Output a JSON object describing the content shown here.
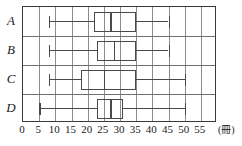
{
  "chart_data": {
    "type": "box",
    "title": "",
    "xlabel": "(冊)",
    "ylabel": "",
    "xlim": [
      0,
      60
    ],
    "xticks": [
      0,
      5,
      10,
      15,
      20,
      25,
      30,
      35,
      40,
      45,
      50,
      55
    ],
    "xtick_labels": [
      "0",
      "5",
      "10",
      "15",
      "20",
      "25",
      "30",
      "35",
      "40",
      "45",
      "50",
      "55"
    ],
    "grid": true,
    "grid_axis": "x",
    "unit_label": "(冊)",
    "categories": [
      "A",
      "B",
      "C",
      "D"
    ],
    "boxes": [
      {
        "label": "A",
        "min": 8,
        "q1": 22,
        "median": 27,
        "q3": 35,
        "max": 45
      },
      {
        "label": "B",
        "min": 8,
        "q1": 23,
        "median": 28,
        "q3": 35,
        "max": 45
      },
      {
        "label": "C",
        "min": 8,
        "q1": 18,
        "median": 25,
        "q3": 35,
        "max": 50
      },
      {
        "label": "D",
        "min": 5,
        "q1": 23,
        "median": 27,
        "q3": 31,
        "max": 50
      }
    ],
    "colors": {
      "frame": "#3a3a3a",
      "grid": "#8d8d8d",
      "box": "#4a4a4a",
      "whisker": "#4a4a4a",
      "text": "#1a1a1a",
      "background": "#ffffff"
    }
  }
}
